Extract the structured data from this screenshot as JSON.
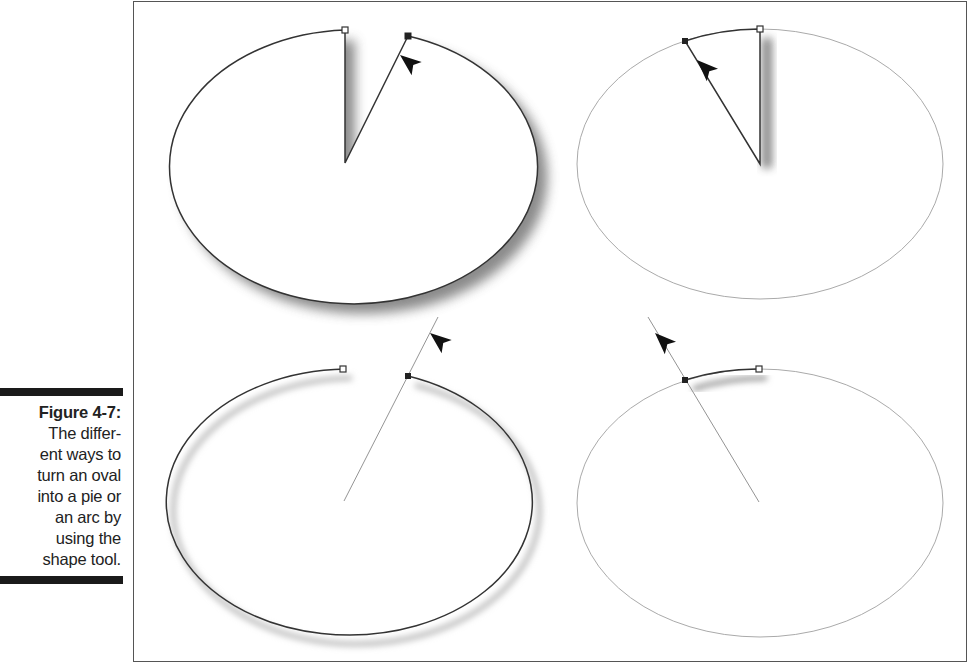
{
  "caption": {
    "label": "Figure 4-7:",
    "lines": [
      "The differ-",
      "ent ways to",
      "turn an oval",
      "into a pie or",
      "an arc by",
      "using the",
      "shape tool."
    ]
  },
  "figure": {
    "panels": [
      {
        "id": "top-left",
        "shape": "pie",
        "style": "solid outline with drop shadow",
        "cursor": "arrow-pointer"
      },
      {
        "id": "top-right",
        "shape": "pie-wedge",
        "style": "thin gray ellipse with dark wedge",
        "cursor": "arrow-pointer"
      },
      {
        "id": "bottom-left",
        "shape": "arc",
        "style": "dark open arc with shadow",
        "cursor": "arrow-pointer"
      },
      {
        "id": "bottom-right",
        "shape": "arc",
        "style": "thin gray ellipse with short dark arc",
        "cursor": "arrow-pointer"
      }
    ],
    "colors": {
      "stroke_dark": "#333333",
      "stroke_light": "#aaaaaa",
      "shadow": "#888888",
      "caption_bar": "#1a1a1a"
    }
  }
}
